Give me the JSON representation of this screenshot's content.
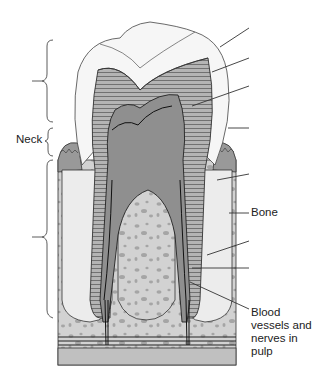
{
  "diagram": {
    "labels": {
      "neck": "Neck",
      "bone": "Bone",
      "blood_vessels": "Blood vessels and nerves in pulp"
    },
    "unlabeled_leader_lines": 8,
    "brackets": [
      "crown",
      "neck",
      "root"
    ],
    "colors": {
      "enamel": "#f4f4f4",
      "dentin": "#a9a9a9",
      "pulp": "#8e8e8e",
      "gum": "#9a9a9a",
      "bone_fill": "#cfcfcf",
      "bone_spots": "#a3a3a3",
      "periodontal": "#ececec",
      "outline": "#333333",
      "base": "#bfbfbf"
    }
  }
}
